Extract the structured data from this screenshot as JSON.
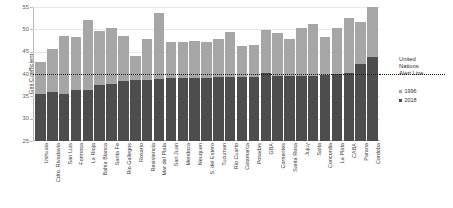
{
  "chart_data": {
    "type": "bar",
    "title": "",
    "subtitle": "",
    "xlabel": "",
    "ylabel": "Gini Coefficient",
    "ylim": [
      25,
      55
    ],
    "yticks": [
      25,
      30,
      35,
      40,
      45,
      50,
      55
    ],
    "grid": true,
    "legend_position": "right",
    "categories": [
      "Ushuaia",
      "Cdro. Rivadavia",
      "San Luis",
      "Formosa",
      "La Rioja",
      "Bahia Blanca",
      "Santa Fe",
      "Rio Gallegos",
      "Rosario",
      "Resistencia",
      "Mar del Plata",
      "San Juan",
      "Mendoza",
      "Neuquen",
      "S. del Estero",
      "Tucuman",
      "Rio Cuarto",
      "Catamarca",
      "Posadas",
      "GBA",
      "Corrientes",
      "Santa Rosa",
      "Jujuy",
      "Salta",
      "Concordia",
      "La Plata",
      "CABA",
      "Parana",
      "Cordoba"
    ],
    "series": [
      {
        "name": "1996",
        "color": "#a6a6a6",
        "values": [
          42.6,
          45.6,
          48.6,
          48.2,
          52.2,
          49.7,
          50.4,
          48.4,
          44.0,
          47.8,
          53.6,
          47.2,
          47.2,
          47.5,
          47.2,
          47.9,
          49.4,
          46.3,
          46.5,
          49.8,
          49.1,
          47.8,
          50.3,
          51.1,
          48.3,
          50.2,
          52.6,
          51.7,
          54.9
        ]
      },
      {
        "name": "2018",
        "color": "#4d4d4d",
        "values": [
          35.6,
          35.9,
          35.6,
          36.4,
          36.4,
          37.6,
          37.7,
          38.4,
          38.6,
          38.7,
          38.9,
          39.0,
          39.0,
          39.1,
          39.2,
          39.3,
          39.4,
          39.4,
          39.4,
          40.3,
          39.6,
          39.5,
          39.6,
          39.6,
          39.8,
          40.1,
          40.2,
          42.3,
          43.8
        ]
      }
    ],
    "annotations": [
      {
        "name": "United Nations Alert Line",
        "value": 40,
        "style": "dotted",
        "color": "#1a1a1a"
      }
    ]
  },
  "legend": {
    "title_lines": [
      "United",
      "Nations",
      "Alert Line"
    ],
    "items": [
      {
        "label": "1996",
        "color": "#a6a6a6"
      },
      {
        "label": "2018",
        "color": "#4d4d4d"
      }
    ]
  },
  "axis": {
    "y_title": "Gini Coefficient"
  }
}
